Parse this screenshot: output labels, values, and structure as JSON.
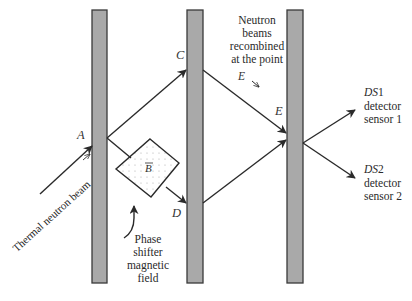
{
  "diagram": {
    "plates": [
      {
        "id": "plate-1",
        "x": 92,
        "y": 10,
        "width": 15,
        "height": 273
      },
      {
        "id": "plate-2",
        "x": 187,
        "y": 10,
        "width": 16,
        "height": 273
      },
      {
        "id": "plate-3",
        "x": 287,
        "y": 10,
        "width": 16,
        "height": 273
      }
    ],
    "colors": {
      "plate_fill": "#a9a9a9",
      "plate_stroke": "#3a3a3a",
      "line": "#2a2a2a",
      "dots": "#b0b0b0"
    },
    "points": {
      "A": "A",
      "C": "C",
      "D": "D",
      "E": "E"
    },
    "labels": {
      "input_beam": "Thermal neutron beam",
      "recombined": [
        "Neutron",
        "beams",
        "recombined",
        "at the point"
      ],
      "recombined_point": "E",
      "phase_shifter": [
        "Phase",
        "shifter",
        "magnetic",
        "field"
      ],
      "field_symbol": "B",
      "ds1_name": "DS",
      "ds1_num": "1",
      "ds1_line2": "detector",
      "ds1_line3": "sensor 1",
      "ds2_name": "DS",
      "ds2_num": "2",
      "ds2_line2": "detector",
      "ds2_line3": "sensor 2"
    }
  }
}
